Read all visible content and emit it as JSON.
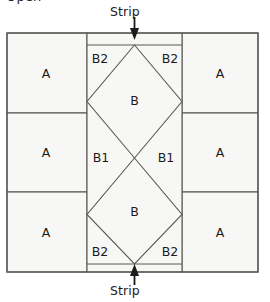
{
  "figure": {
    "partial_caption_top": "Open",
    "background_color": "#ffffff",
    "patch_fill": "#f7f7f6",
    "line_color": "#595857",
    "text_color": "#1d1b1a"
  },
  "annotations": {
    "strip_top": "Strip",
    "strip_bottom": "Strip"
  },
  "patches": {
    "a_top_left": "A",
    "a_mid_left": "A",
    "a_bottom_left": "A",
    "a_top_right": "A",
    "a_mid_right": "A",
    "a_bottom_right": "A",
    "b_upper": "B",
    "b_lower": "B",
    "b2_top_left": "B2",
    "b2_top_right": "B2",
    "b2_bottom_left": "B2",
    "b2_bottom_right": "B2",
    "b1_left": "B1",
    "b1_right": "B1"
  },
  "geometry": {
    "outer": {
      "x": 7,
      "y": 33,
      "width": 251,
      "height": 239
    },
    "center_panel": {
      "x": 87,
      "y": 33,
      "width": 95,
      "height": 239
    },
    "strip_top_line_y": 45,
    "strip_bottom_line_y": 264,
    "left_divider_y": [
      113,
      192
    ],
    "right_divider_y": [
      113,
      192
    ],
    "diamond_cross_y": 158
  }
}
